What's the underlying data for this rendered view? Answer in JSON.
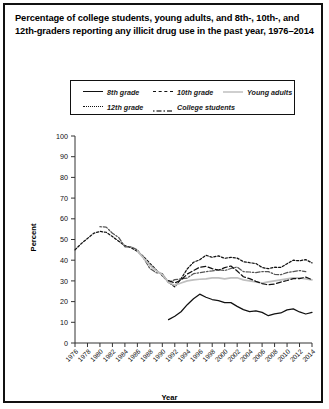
{
  "title": "Percentage of college students, young adults, and 8th-, 10th-, and 12th-graders reporting any illicit drug use in the past year, 1976–2014",
  "legend": {
    "items": [
      {
        "label": "8th grade",
        "style": "solid",
        "color": "#111111"
      },
      {
        "label": "10th grade",
        "style": "dashed-long",
        "color": "#111111"
      },
      {
        "label": "Young adults",
        "style": "solid",
        "color": "#bfbfbf"
      },
      {
        "label": "12th grade",
        "style": "dashed-short",
        "color": "#111111"
      },
      {
        "label": "College students",
        "style": "dash-dot",
        "color": "#555555"
      }
    ]
  },
  "axes": {
    "ylabel": "Percent",
    "xlabel": "Year",
    "yticks": [
      0,
      10,
      20,
      30,
      40,
      50,
      60,
      70,
      80,
      90,
      100
    ],
    "xticks": [
      1976,
      1978,
      1980,
      1982,
      1984,
      1986,
      1988,
      1990,
      1992,
      1994,
      1996,
      1998,
      2000,
      2002,
      2004,
      2006,
      2008,
      2010,
      2012,
      2014
    ]
  },
  "chart_data": {
    "type": "line",
    "title": "Percentage of college students, young adults, and 8th-, 10th-, and 12th-graders reporting any illicit drug use in the past year, 1976–2014",
    "xlabel": "Year",
    "ylabel": "Percent",
    "xlim": [
      1976,
      2014
    ],
    "ylim": [
      0,
      100
    ],
    "grid": false,
    "legend_position": "top",
    "series": [
      {
        "name": "12th grade",
        "style": "dashed-short",
        "color": "#111111",
        "x": [
          1976,
          1977,
          1978,
          1979,
          1980,
          1981,
          1982,
          1983,
          1984,
          1985,
          1986,
          1987,
          1988,
          1989,
          1990,
          1991,
          1992,
          1993,
          1994,
          1995,
          1996,
          1997,
          1998,
          1999,
          2000,
          2001,
          2002,
          2003,
          2004,
          2005,
          2006,
          2007,
          2008,
          2009,
          2010,
          2011,
          2012,
          2013,
          2014
        ],
        "y": [
          45.0,
          48.0,
          50.5,
          53.0,
          53.9,
          53.5,
          51.4,
          49.2,
          47.0,
          46.0,
          44.3,
          41.7,
          38.5,
          35.4,
          32.5,
          29.4,
          27.1,
          31.0,
          35.8,
          39.0,
          40.2,
          42.4,
          41.4,
          42.1,
          40.9,
          41.4,
          41.0,
          39.3,
          38.8,
          38.4,
          36.5,
          35.9,
          36.6,
          36.5,
          38.3,
          40.0,
          39.7,
          40.3,
          38.7
        ]
      },
      {
        "name": "College students",
        "style": "dash-dot",
        "color": "#555555",
        "x": [
          1980,
          1981,
          1982,
          1983,
          1984,
          1985,
          1986,
          1987,
          1988,
          1989,
          1990,
          1991,
          1992,
          1993,
          1994,
          1995,
          1996,
          1997,
          1998,
          1999,
          2000,
          2001,
          2002,
          2003,
          2004,
          2005,
          2006,
          2007,
          2008,
          2009,
          2010,
          2011,
          2012,
          2013
        ],
        "y": [
          56.2,
          56.0,
          53.0,
          51.0,
          46.5,
          46.5,
          45.0,
          41.0,
          36.0,
          34.0,
          33.5,
          29.2,
          30.6,
          31.0,
          31.4,
          33.5,
          34.0,
          34.5,
          34.8,
          35.4,
          35.0,
          36.0,
          36.7,
          34.5,
          34.3,
          34.0,
          34.5,
          34.5,
          33.2,
          33.0,
          34.0,
          34.5,
          35.0,
          34.5
        ]
      },
      {
        "name": "Young adults",
        "style": "solid",
        "color": "#bfbfbf",
        "x": [
          1986,
          1987,
          1988,
          1989,
          1990,
          1991,
          1992,
          1993,
          1994,
          1995,
          1996,
          1997,
          1998,
          1999,
          2000,
          2001,
          2002,
          2003,
          2004,
          2005,
          2006,
          2007,
          2008,
          2009,
          2010,
          2011,
          2012,
          2013,
          2014
        ],
        "y": [
          44.5,
          41.0,
          37.5,
          35.0,
          33.0,
          29.2,
          27.9,
          29.0,
          30.0,
          30.5,
          30.8,
          31.0,
          31.5,
          31.5,
          31.0,
          31.5,
          31.5,
          30.5,
          30.0,
          29.5,
          29.0,
          29.5,
          30.0,
          30.5,
          31.0,
          31.5,
          31.5,
          31.0,
          30.5
        ]
      },
      {
        "name": "10th grade",
        "style": "dashed-long",
        "color": "#111111",
        "x": [
          1991,
          1992,
          1993,
          1994,
          1995,
          1996,
          1997,
          1998,
          1999,
          2000,
          2001,
          2002,
          2003,
          2004,
          2005,
          2006,
          2007,
          2008,
          2009,
          2010,
          2011,
          2012,
          2013,
          2014
        ],
        "y": [
          30.1,
          29.0,
          30.4,
          33.3,
          35.0,
          36.6,
          37.0,
          35.9,
          35.2,
          36.4,
          37.2,
          34.8,
          32.0,
          31.1,
          29.8,
          28.7,
          28.1,
          28.5,
          29.4,
          30.2,
          31.1,
          31.1,
          31.8,
          30.6
        ]
      },
      {
        "name": "8th grade",
        "style": "solid",
        "color": "#111111",
        "x": [
          1991,
          1992,
          1993,
          1994,
          1995,
          1996,
          1997,
          1998,
          1999,
          2000,
          2001,
          2002,
          2003,
          2004,
          2005,
          2006,
          2007,
          2008,
          2009,
          2010,
          2011,
          2012,
          2013,
          2014
        ],
        "y": [
          11.3,
          12.9,
          15.1,
          18.5,
          21.4,
          23.6,
          22.1,
          21.0,
          20.5,
          19.5,
          19.5,
          17.7,
          16.1,
          15.2,
          15.5,
          14.8,
          13.2,
          14.1,
          14.5,
          16.0,
          16.5,
          15.0,
          14.0,
          14.8
        ]
      }
    ]
  }
}
